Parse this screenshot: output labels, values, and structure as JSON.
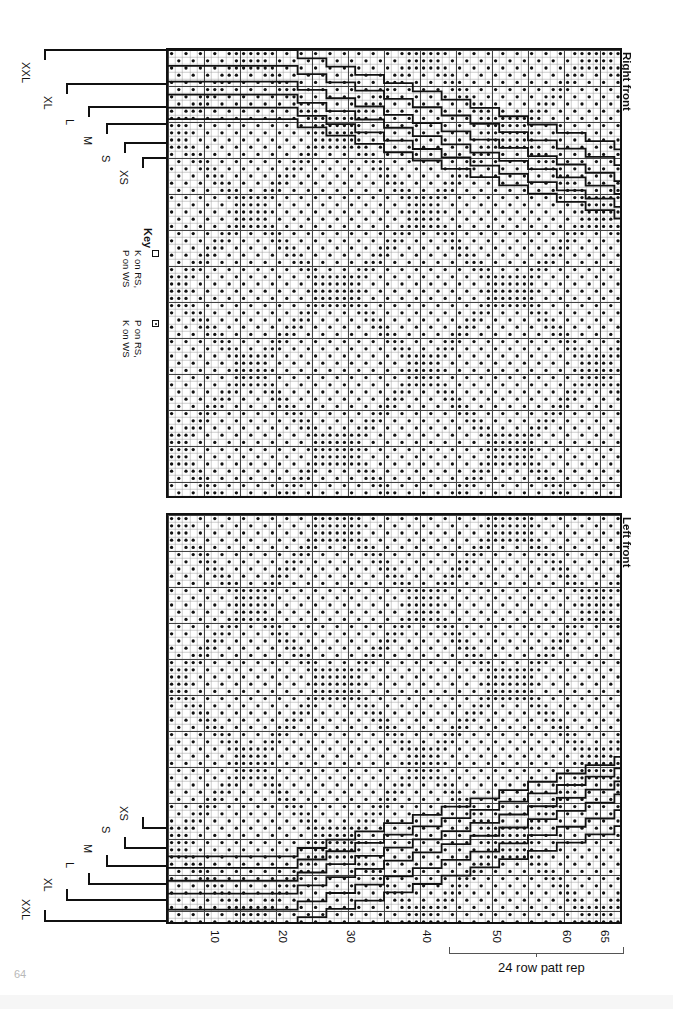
{
  "document": {
    "page_number": "64",
    "type": "knitting stitch chart"
  },
  "panels": [
    {
      "id": "right-front",
      "label": "Right front"
    },
    {
      "id": "left-front",
      "label": "Left front"
    }
  ],
  "key": {
    "title": "Key",
    "entries": [
      {
        "symbol": "empty-square",
        "line1": "K on RS,",
        "line2": "P on WS"
      },
      {
        "symbol": "dotted-square",
        "line1": "P on RS,",
        "line2": "K on WS"
      }
    ]
  },
  "sizes_top": [
    "XXL",
    "XL",
    "L",
    "M",
    "S",
    "XS"
  ],
  "sizes_bottom": [
    "XS",
    "S",
    "M",
    "L",
    "XL",
    "XXL"
  ],
  "row_numbers": [
    "10",
    "20",
    "30",
    "40",
    "50",
    "60",
    "65"
  ],
  "repeat": {
    "label": "24 row patt rep",
    "rows": 24
  },
  "colors": {
    "ink": "#111111",
    "grid_line": "#9a9a9a",
    "grid_major": "#444444",
    "paper": "#ffffff",
    "page_number": "#b8b8b8"
  },
  "chart_data": {
    "type": "heatmap",
    "xlabel": "row number",
    "ylabel": "stitch number",
    "legend": [
      "K on RS, P on WS (empty)",
      "P on RS, K on WS (dot)"
    ],
    "grid": true,
    "total_rows": 65,
    "repeat_rows": 24,
    "cell_px": 7.2,
    "major_every": 5
  }
}
